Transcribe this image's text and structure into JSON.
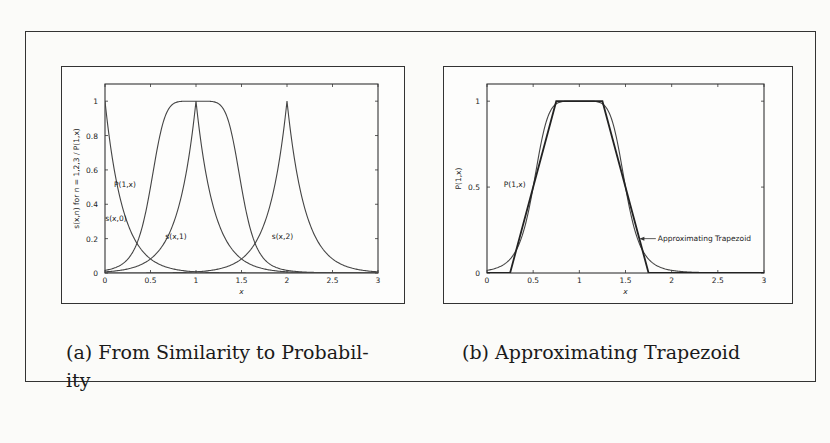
{
  "figure": {
    "captions": {
      "a": "(a) From Similarity to Probability",
      "a_line1": "(a) From Similarity to Probabil-",
      "a_line2": "ity",
      "b": "(b) Approximating Trapezoid"
    }
  },
  "chart_data": [
    {
      "id": "a",
      "type": "line",
      "title": "(a) From Similarity to Probability",
      "xlabel": "x",
      "ylabel": "s(x,n) for n = 1,2,3 / P(1,x)",
      "xlim": [
        0,
        3
      ],
      "ylim": [
        0,
        1.1
      ],
      "xticks": [
        "0",
        "0.5",
        "1",
        "1.5",
        "2",
        "2.5",
        "3"
      ],
      "yticks": [
        "0",
        "0.2",
        "0.4",
        "0.6",
        "0.8",
        "1"
      ],
      "grid": false,
      "legend": "none (inline labels)",
      "series": [
        {
          "name": "P(1,x)",
          "label_pos": [
            0.22,
            0.5
          ],
          "x": [
            0,
            0.1,
            0.2,
            0.3,
            0.4,
            0.5,
            0.6,
            0.7,
            0.8,
            0.9,
            1.0,
            1.1,
            1.2,
            1.3,
            1.4,
            1.5,
            1.6,
            1.7,
            1.8,
            1.9,
            2.0,
            2.2,
            2.5,
            3.0
          ],
          "values": [
            0.0,
            0.003,
            0.02,
            0.07,
            0.2,
            0.45,
            0.72,
            0.9,
            0.97,
            0.995,
            1.0,
            0.995,
            0.97,
            0.9,
            0.72,
            0.45,
            0.2,
            0.07,
            0.02,
            0.003,
            0.0,
            0.0,
            0.0,
            0.0
          ]
        },
        {
          "name": "s(x,0)",
          "label_pos": [
            0.12,
            0.3
          ],
          "x": [
            0,
            0.1,
            0.2,
            0.3,
            0.4,
            0.5,
            0.6,
            0.8,
            1.0,
            1.5,
            2.0,
            3.0
          ],
          "values": [
            1.0,
            0.6,
            0.36,
            0.22,
            0.13,
            0.08,
            0.05,
            0.02,
            0.007,
            0.001,
            0.0,
            0.0
          ]
        },
        {
          "name": "s(x,1)",
          "label_pos": [
            0.78,
            0.2
          ],
          "x": [
            0,
            0.3,
            0.5,
            0.6,
            0.7,
            0.8,
            0.9,
            1.0,
            1.1,
            1.2,
            1.3,
            1.4,
            1.5,
            1.7,
            2.0,
            3.0
          ],
          "values": [
            0.0,
            0.01,
            0.05,
            0.13,
            0.22,
            0.36,
            0.6,
            1.0,
            0.6,
            0.36,
            0.22,
            0.13,
            0.08,
            0.02,
            0.007,
            0.0
          ],
          "_note": "symmetric cusp peak at x=1"
        },
        {
          "name": "s(x,2)",
          "label_pos": [
            1.95,
            0.2
          ],
          "x": [
            0,
            1.0,
            1.3,
            1.5,
            1.6,
            1.7,
            1.8,
            1.9,
            2.0,
            2.1,
            2.2,
            2.3,
            2.4,
            2.5,
            2.7,
            3.0
          ],
          "values": [
            0.0,
            0.0,
            0.01,
            0.05,
            0.13,
            0.22,
            0.36,
            0.6,
            1.0,
            0.6,
            0.36,
            0.22,
            0.13,
            0.08,
            0.02,
            0.003
          ]
        }
      ]
    },
    {
      "id": "b",
      "type": "line",
      "title": "(b) Approximating Trapezoid",
      "xlabel": "x",
      "ylabel": "P(1,x)",
      "xlim": [
        0,
        3
      ],
      "ylim": [
        0,
        1.1
      ],
      "xticks": [
        "0",
        "0.5",
        "1",
        "1.5",
        "2",
        "2.5",
        "3"
      ],
      "yticks": [
        "0",
        "0.5",
        "1"
      ],
      "grid": false,
      "legend": "none (inline labels with arrow)",
      "annotations": [
        {
          "text": "P(1,x)",
          "x": 0.3,
          "y": 0.5
        },
        {
          "text": "Approximating Trapezoid",
          "x": 1.85,
          "y": 0.2,
          "arrow_to": [
            1.65,
            0.2
          ]
        }
      ],
      "series": [
        {
          "name": "P(1,x)",
          "x": [
            0,
            0.1,
            0.2,
            0.3,
            0.4,
            0.5,
            0.6,
            0.7,
            0.8,
            0.9,
            1.0,
            1.1,
            1.2,
            1.3,
            1.4,
            1.5,
            1.6,
            1.7,
            1.8,
            1.9,
            2.0,
            3.0
          ],
          "values": [
            0.0,
            0.003,
            0.02,
            0.07,
            0.2,
            0.45,
            0.72,
            0.9,
            0.97,
            0.995,
            1.0,
            0.995,
            0.97,
            0.9,
            0.72,
            0.45,
            0.2,
            0.07,
            0.02,
            0.003,
            0.0,
            0.0
          ]
        },
        {
          "name": "Approximating Trapezoid",
          "x": [
            0,
            0.25,
            0.75,
            1.25,
            1.75,
            3.0
          ],
          "values": [
            0.0,
            0.0,
            1.0,
            1.0,
            0.0,
            0.0
          ]
        }
      ]
    }
  ]
}
